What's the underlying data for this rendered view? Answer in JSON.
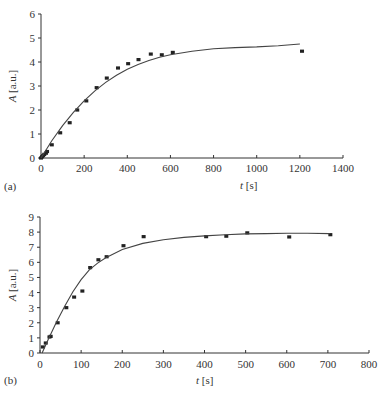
{
  "chart_data": [
    {
      "id": "a",
      "type": "scatter",
      "panel_label": "(a)",
      "title": "",
      "xlabel_var": "t",
      "xlabel_unit": "[s]",
      "ylabel_var": "A",
      "ylabel_unit": "[a.u.]",
      "xlim": [
        0,
        1400
      ],
      "ylim": [
        0,
        6
      ],
      "xticks": [
        0,
        200,
        400,
        600,
        800,
        1000,
        1200,
        1400
      ],
      "yticks": [
        0,
        1,
        2,
        3,
        4,
        5,
        6
      ],
      "grid": false,
      "series": [
        {
          "name": "measured",
          "kind": "points",
          "x": [
            0,
            5,
            10,
            15,
            23,
            28,
            50,
            89,
            133,
            168,
            210,
            258,
            305,
            357,
            404,
            452,
            509,
            560,
            611,
            1210
          ],
          "y": [
            0,
            0.05,
            0.1,
            0.15,
            0.2,
            0.27,
            0.55,
            1.05,
            1.47,
            2.0,
            2.38,
            2.93,
            3.33,
            3.75,
            3.93,
            4.1,
            4.33,
            4.3,
            4.4,
            4.45
          ]
        },
        {
          "name": "fit",
          "kind": "line",
          "x": [
            0,
            50,
            100,
            150,
            200,
            250,
            300,
            350,
            400,
            450,
            500,
            550,
            600,
            700,
            800,
            900,
            1000,
            1100,
            1200
          ],
          "y": [
            0,
            0.72,
            1.35,
            1.9,
            2.38,
            2.8,
            3.15,
            3.45,
            3.7,
            3.9,
            4.06,
            4.2,
            4.3,
            4.45,
            4.55,
            4.6,
            4.63,
            4.68,
            4.75
          ]
        }
      ]
    },
    {
      "id": "b",
      "type": "scatter",
      "panel_label": "(b)",
      "title": "",
      "xlabel_var": "t",
      "xlabel_unit": "[s]",
      "ylabel_var": "A",
      "ylabel_unit": "[a.u.]",
      "xlim": [
        0,
        800
      ],
      "ylim": [
        0,
        9
      ],
      "xticks": [
        0,
        100,
        200,
        300,
        400,
        500,
        600,
        700,
        800
      ],
      "yticks": [
        0,
        1,
        2,
        3,
        4,
        5,
        6,
        7,
        8,
        9
      ],
      "grid": false,
      "series": [
        {
          "name": "measured",
          "kind": "points",
          "x": [
            7,
            14,
            23,
            26,
            43,
            64,
            83,
            103,
            122,
            142,
            162,
            203,
            252,
            404,
            453,
            504,
            606,
            706
          ],
          "y": [
            0.4,
            0.66,
            1.06,
            1.1,
            2.0,
            3.0,
            3.7,
            4.1,
            5.65,
            6.17,
            6.37,
            7.1,
            7.7,
            7.7,
            7.73,
            7.95,
            7.68,
            7.83
          ]
        },
        {
          "name": "fit",
          "kind": "line",
          "x": [
            5,
            20,
            40,
            60,
            80,
            100,
            120,
            140,
            160,
            200,
            250,
            300,
            350,
            400,
            450,
            500,
            550,
            600,
            650,
            705
          ],
          "y": [
            0,
            0.9,
            2.05,
            3.1,
            4.05,
            4.85,
            5.5,
            5.95,
            6.3,
            6.85,
            7.25,
            7.5,
            7.65,
            7.75,
            7.82,
            7.88,
            7.9,
            7.92,
            7.92,
            7.9
          ]
        }
      ]
    }
  ]
}
